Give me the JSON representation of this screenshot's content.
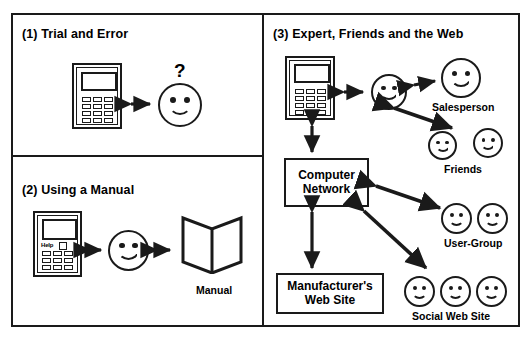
{
  "diagram": {
    "title_present": false,
    "stroke_color": "#1a1a1a",
    "background": "#ffffff"
  },
  "panels": [
    {
      "id": "panel-1",
      "title": "(1) Trial and Error"
    },
    {
      "id": "panel-2",
      "title": "(2) Using a Manual"
    },
    {
      "id": "panel-3",
      "title": "(3) Expert, Friends and the Web"
    }
  ],
  "panel1": {
    "title": "(1) Trial and Error",
    "device": "calculator",
    "question_mark": "?",
    "actors": [
      "user-face"
    ],
    "relations": [
      {
        "from": "calculator",
        "to": "user",
        "type": "bidirectional"
      }
    ]
  },
  "panel2": {
    "title": "(2) Using a Manual",
    "device": "calculator-with-help",
    "help_label": "Help",
    "manual_label": "Manual",
    "relations": [
      {
        "from": "calculator",
        "to": "user",
        "type": "bidirectional"
      },
      {
        "from": "user",
        "to": "manual",
        "type": "bidirectional"
      }
    ]
  },
  "panel3": {
    "title": "(3) Expert, Friends and the Web",
    "nodes": {
      "calculator": "calculator",
      "user": "user-face",
      "salesperson_label": "Salesperson",
      "friends_label": "Friends",
      "network_label": "Computer\nNetwork",
      "network_line1": "Computer",
      "network_line2": "Network",
      "usergroup_label": "User-Group",
      "manufacturer_line1": "Manufacturer's",
      "manufacturer_line2": "Web Site",
      "social_label": "Social Web Site"
    },
    "counts": {
      "friends_faces": 2,
      "usergroup_faces": 2,
      "social_faces": 3,
      "salesperson_faces": 1
    },
    "relations": [
      {
        "from": "calculator",
        "to": "user",
        "type": "bidirectional"
      },
      {
        "from": "user",
        "to": "salesperson",
        "type": "bidirectional"
      },
      {
        "from": "user",
        "to": "friends",
        "type": "bidirectional"
      },
      {
        "from": "calculator",
        "to": "computer-network",
        "type": "bidirectional"
      },
      {
        "from": "computer-network",
        "to": "user-group",
        "type": "bidirectional"
      },
      {
        "from": "computer-network",
        "to": "manufacturers-web-site",
        "type": "bidirectional"
      },
      {
        "from": "computer-network",
        "to": "social-web-site",
        "type": "bidirectional"
      }
    ]
  }
}
